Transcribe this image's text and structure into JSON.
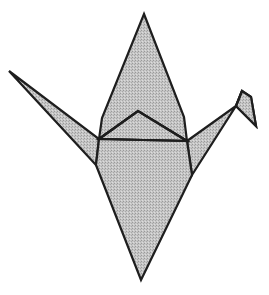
{
  "figure": {
    "style": "line drawing with dithered gray fill",
    "colors": {
      "background": "#ffffff",
      "fill": "#bdbdbd",
      "fill_dark": "#9a9a9a",
      "fill_light": "#dcdcdc",
      "stroke": "#1e1e1e"
    },
    "caption": ""
  },
  "shapes": {
    "neck_upper": "144,14 184,117 187,141 138,111 99,139 102,118",
    "inner_triangle": "99,139 138,111 187,141",
    "body": "99,139 187,141 192,175 141,280 96,165",
    "left_wing_tail": "9,71 99,139 96,165",
    "right_wing_neck": "187,141 236,106 242,91 251,97 256,126 236,106 192,175",
    "head": "242,91 251,97 256,126 236,106"
  },
  "creases": {
    "shoulder_line": "99,139 187,141",
    "inner_fold": "99,139 138,111 187,141",
    "head_fold": "242,91 236,106"
  }
}
